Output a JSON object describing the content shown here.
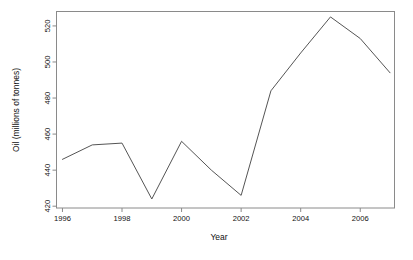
{
  "chart_data": {
    "type": "line",
    "title": "",
    "xlabel": "Year",
    "ylabel": "Oil (millions of tonnes)",
    "x": [
      1996,
      1997,
      1998,
      1999,
      2000,
      2001,
      2002,
      2003,
      2004,
      2005,
      2006,
      2007
    ],
    "values": [
      446,
      454,
      455,
      424,
      456,
      440,
      426,
      484,
      505,
      525,
      513,
      494
    ],
    "series": [
      {
        "name": "Oil",
        "values": [
          446,
          454,
          455,
          424,
          456,
          440,
          426,
          484,
          505,
          525,
          513,
          494
        ]
      }
    ],
    "xlim": [
      1995.8,
      2007.15
    ],
    "ylim": [
      419,
      528
    ],
    "xticks": [
      1996,
      1998,
      2000,
      2002,
      2004,
      2006
    ],
    "xtick_labels": [
      "1996",
      "1998",
      "2000",
      "2002",
      "2004",
      "2006"
    ],
    "yticks": [
      420,
      440,
      460,
      480,
      500,
      520
    ],
    "ytick_labels": [
      "420",
      "440",
      "460",
      "480",
      "500",
      "520"
    ],
    "grid": false,
    "legend": null,
    "line_color": "#555555",
    "box_color": "#808080",
    "background": "#ffffff"
  },
  "labels": {
    "x_axis_title": "Year",
    "y_axis_title": "Oil (millions of tonnes)"
  }
}
